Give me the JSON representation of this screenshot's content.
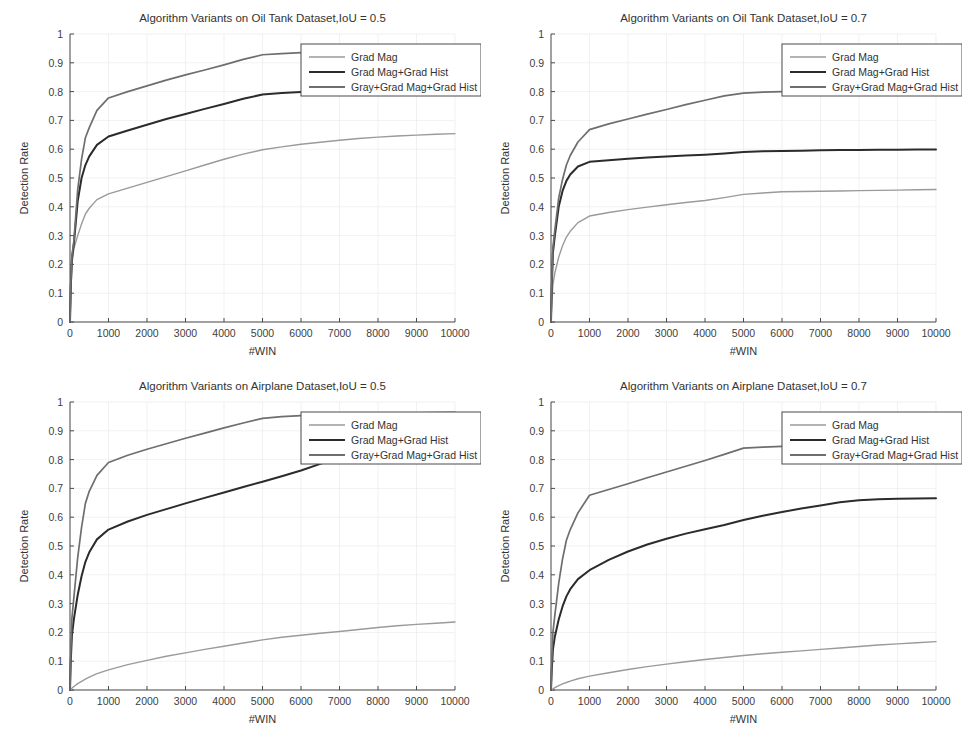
{
  "figure": {
    "background": "#ffffff",
    "panel_count": 4,
    "common": {
      "xlabel": "#WIN",
      "ylabel": "Detection Rate",
      "xticks": [
        "0",
        "1000",
        "2000",
        "3000",
        "4000",
        "5000",
        "6000",
        "7000",
        "8000",
        "9000",
        "10000"
      ],
      "yticks": [
        "0",
        "0.1",
        "0.2",
        "0.3",
        "0.4",
        "0.5",
        "0.6",
        "0.7",
        "0.8",
        "0.9",
        "1"
      ],
      "legend_labels": [
        "Grad Mag",
        "Grad Mag+Grad Hist",
        "Gray+Grad Mag+Grad Hist"
      ],
      "series_colors": [
        "#9a9a9a",
        "#2b2b2b",
        "#6e6e6e"
      ]
    }
  },
  "chart_data": [
    {
      "id": "oil-tank-iou05",
      "type": "line",
      "title": "Algorithm Variants on Oil Tank Dataset,IoU = 0.5",
      "xlabel": "#WIN",
      "ylabel": "Detection Rate",
      "xlim": [
        0,
        10000
      ],
      "ylim": [
        0,
        1
      ],
      "grid": true,
      "legend_position": "upper right",
      "x": [
        0,
        20,
        50,
        100,
        200,
        300,
        400,
        500,
        700,
        1000,
        1500,
        2000,
        2500,
        3000,
        3500,
        4000,
        4500,
        5000,
        5500,
        6000,
        6500,
        7000,
        7500,
        8000,
        8500,
        9000,
        9500,
        10000
      ],
      "series": [
        {
          "name": "Grad Mag",
          "color": "#9a9a9a",
          "values": [
            0.0,
            0.1,
            0.2,
            0.255,
            0.3,
            0.34,
            0.375,
            0.395,
            0.425,
            0.445,
            0.465,
            0.485,
            0.505,
            0.525,
            0.545,
            0.565,
            0.583,
            0.598,
            0.608,
            0.617,
            0.624,
            0.631,
            0.637,
            0.642,
            0.646,
            0.649,
            0.652,
            0.654
          ]
        },
        {
          "name": "Grad Mag+Grad Hist",
          "color": "#2b2b2b",
          "values": [
            0.0,
            0.12,
            0.22,
            0.27,
            0.42,
            0.5,
            0.545,
            0.575,
            0.615,
            0.644,
            0.665,
            0.685,
            0.705,
            0.722,
            0.74,
            0.757,
            0.775,
            0.79,
            0.795,
            0.799,
            0.803,
            0.808,
            0.813,
            0.817,
            0.819,
            0.821,
            0.822,
            0.823
          ]
        },
        {
          "name": "Gray+Grad Mag+Grad Hist",
          "color": "#6e6e6e",
          "values": [
            0.0,
            0.13,
            0.23,
            0.28,
            0.46,
            0.565,
            0.64,
            0.675,
            0.735,
            0.778,
            0.8,
            0.82,
            0.84,
            0.858,
            0.875,
            0.893,
            0.912,
            0.928,
            0.932,
            0.935,
            0.937,
            0.939,
            0.94,
            0.941,
            0.942,
            0.943,
            0.944,
            0.945
          ]
        }
      ]
    },
    {
      "id": "oil-tank-iou07",
      "type": "line",
      "title": "Algorithm Variants on Oil Tank Dataset,IoU = 0.7",
      "xlabel": "#WIN",
      "ylabel": "Detection Rate",
      "xlim": [
        0,
        10000
      ],
      "ylim": [
        0,
        1
      ],
      "grid": true,
      "legend_position": "upper right",
      "x": [
        0,
        20,
        50,
        100,
        200,
        300,
        400,
        500,
        700,
        1000,
        1500,
        2000,
        2500,
        3000,
        3500,
        4000,
        4500,
        5000,
        5500,
        6000,
        6500,
        7000,
        7500,
        8000,
        8500,
        9000,
        9500,
        10000
      ],
      "series": [
        {
          "name": "Grad Mag",
          "color": "#9a9a9a",
          "values": [
            0.0,
            0.07,
            0.13,
            0.17,
            0.225,
            0.265,
            0.295,
            0.315,
            0.345,
            0.368,
            0.38,
            0.39,
            0.399,
            0.407,
            0.415,
            0.422,
            0.432,
            0.443,
            0.448,
            0.452,
            0.453,
            0.454,
            0.455,
            0.456,
            0.457,
            0.458,
            0.459,
            0.46
          ]
        },
        {
          "name": "Grad Mag+Grad Hist",
          "color": "#2b2b2b",
          "values": [
            0.0,
            0.12,
            0.24,
            0.3,
            0.4,
            0.455,
            0.49,
            0.512,
            0.54,
            0.556,
            0.562,
            0.567,
            0.571,
            0.575,
            0.578,
            0.581,
            0.585,
            0.59,
            0.593,
            0.594,
            0.595,
            0.596,
            0.597,
            0.597,
            0.598,
            0.598,
            0.599,
            0.599
          ]
        },
        {
          "name": "Gray+Grad Mag+Grad Hist",
          "color": "#6e6e6e",
          "values": [
            0.0,
            0.13,
            0.26,
            0.32,
            0.43,
            0.495,
            0.545,
            0.578,
            0.625,
            0.668,
            0.688,
            0.705,
            0.722,
            0.738,
            0.755,
            0.77,
            0.785,
            0.795,
            0.798,
            0.8,
            0.803,
            0.806,
            0.808,
            0.81,
            0.811,
            0.812,
            0.813,
            0.814
          ]
        }
      ]
    },
    {
      "id": "airplane-iou05",
      "type": "line",
      "title": "Algorithm Variants on Airplane Dataset,IoU = 0.5",
      "xlabel": "#WIN",
      "ylabel": "Detection Rate",
      "xlim": [
        0,
        10000
      ],
      "ylim": [
        0,
        1
      ],
      "grid": true,
      "legend_position": "upper right",
      "x": [
        0,
        20,
        50,
        100,
        200,
        300,
        400,
        500,
        700,
        1000,
        1500,
        2000,
        2500,
        3000,
        3500,
        4000,
        4500,
        5000,
        5500,
        6000,
        6500,
        7000,
        7500,
        8000,
        8500,
        9000,
        9500,
        10000
      ],
      "series": [
        {
          "name": "Grad Mag",
          "color": "#9a9a9a",
          "values": [
            0.0,
            0.002,
            0.006,
            0.012,
            0.022,
            0.03,
            0.038,
            0.045,
            0.057,
            0.07,
            0.088,
            0.103,
            0.117,
            0.129,
            0.141,
            0.152,
            0.163,
            0.174,
            0.183,
            0.19,
            0.197,
            0.203,
            0.21,
            0.217,
            0.223,
            0.228,
            0.232,
            0.236
          ]
        },
        {
          "name": "Grad Mag+Grad Hist",
          "color": "#2b2b2b",
          "values": [
            0.0,
            0.1,
            0.19,
            0.245,
            0.33,
            0.395,
            0.445,
            0.478,
            0.523,
            0.557,
            0.585,
            0.608,
            0.628,
            0.648,
            0.667,
            0.686,
            0.705,
            0.723,
            0.742,
            0.762,
            0.785,
            0.808,
            0.826,
            0.838,
            0.848,
            0.855,
            0.861,
            0.866
          ]
        },
        {
          "name": "Gray+Grad Mag+Grad Hist",
          "color": "#6e6e6e",
          "values": [
            0.0,
            0.13,
            0.25,
            0.32,
            0.46,
            0.565,
            0.648,
            0.69,
            0.745,
            0.79,
            0.815,
            0.836,
            0.855,
            0.874,
            0.892,
            0.91,
            0.927,
            0.943,
            0.949,
            0.953,
            0.956,
            0.958,
            0.959,
            0.96,
            0.961,
            0.962,
            0.963,
            0.964
          ]
        }
      ]
    },
    {
      "id": "airplane-iou07",
      "type": "line",
      "title": "Algorithm Variants on Airplane Dataset,IoU = 0.7",
      "xlabel": "#WIN",
      "ylabel": "Detection Rate",
      "xlim": [
        0,
        10000
      ],
      "ylim": [
        0,
        1
      ],
      "grid": true,
      "legend_position": "upper right",
      "x": [
        0,
        20,
        50,
        100,
        200,
        300,
        400,
        500,
        700,
        1000,
        1500,
        2000,
        2500,
        3000,
        3500,
        4000,
        4500,
        5000,
        5500,
        6000,
        6500,
        7000,
        7500,
        8000,
        8500,
        9000,
        9500,
        10000
      ],
      "series": [
        {
          "name": "Grad Mag",
          "color": "#9a9a9a",
          "values": [
            0.0,
            0.001,
            0.004,
            0.008,
            0.015,
            0.021,
            0.026,
            0.031,
            0.039,
            0.048,
            0.06,
            0.071,
            0.081,
            0.09,
            0.098,
            0.106,
            0.113,
            0.12,
            0.126,
            0.131,
            0.136,
            0.141,
            0.146,
            0.151,
            0.156,
            0.16,
            0.164,
            0.168
          ]
        },
        {
          "name": "Grad Mag+Grad Hist",
          "color": "#2b2b2b",
          "values": [
            0.0,
            0.07,
            0.14,
            0.185,
            0.245,
            0.29,
            0.325,
            0.35,
            0.385,
            0.416,
            0.452,
            0.481,
            0.505,
            0.525,
            0.543,
            0.558,
            0.573,
            0.59,
            0.605,
            0.618,
            0.63,
            0.641,
            0.652,
            0.659,
            0.662,
            0.664,
            0.665,
            0.666
          ]
        },
        {
          "name": "Gray+Grad Mag+Grad Hist",
          "color": "#6e6e6e",
          "values": [
            0.0,
            0.1,
            0.2,
            0.26,
            0.37,
            0.455,
            0.52,
            0.557,
            0.615,
            0.676,
            0.696,
            0.716,
            0.737,
            0.757,
            0.777,
            0.797,
            0.818,
            0.84,
            0.843,
            0.846,
            0.848,
            0.85,
            0.851,
            0.852,
            0.853,
            0.853,
            0.854,
            0.855
          ]
        }
      ]
    }
  ]
}
